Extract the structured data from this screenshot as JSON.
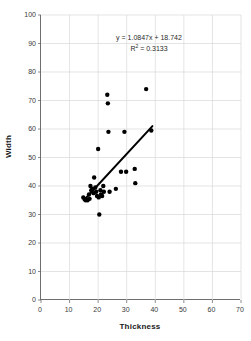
{
  "chart_data": {
    "type": "scatter",
    "title": "",
    "xlabel": "Thickness",
    "ylabel": "Width",
    "xlim": [
      0,
      70
    ],
    "ylim": [
      0,
      100
    ],
    "xticks": [
      0,
      10,
      20,
      30,
      40,
      50,
      60,
      70
    ],
    "yticks": [
      0,
      10,
      20,
      30,
      40,
      50,
      60,
      70,
      80,
      90,
      100
    ],
    "grid": true,
    "legend": false,
    "marker_color": "#000000",
    "gridline_color": "#d9d9d9",
    "axis_color": "#6e6e6e",
    "trendline_color": "#000000",
    "annotations": {
      "equation": "y = 1.0847x + 18.742",
      "r_squared_prefix": "R",
      "r_squared_sup": "2",
      "r_squared_value": " = 0.3133"
    },
    "series": [
      {
        "name": "Thickness vs Width",
        "points": [
          [
            14.8,
            36.0
          ],
          [
            15.2,
            35.5
          ],
          [
            15.6,
            35.0
          ],
          [
            16.0,
            35.2
          ],
          [
            16.3,
            35.0
          ],
          [
            16.8,
            37.0
          ],
          [
            17.0,
            35.5
          ],
          [
            17.3,
            40.0
          ],
          [
            17.6,
            38.5
          ],
          [
            18.0,
            39.0
          ],
          [
            18.4,
            37.5
          ],
          [
            18.6,
            43.0
          ],
          [
            19.0,
            39.5
          ],
          [
            19.3,
            38.0
          ],
          [
            19.6,
            36.5
          ],
          [
            20.0,
            53.0
          ],
          [
            20.2,
            36.0
          ],
          [
            20.4,
            30.0
          ],
          [
            20.8,
            38.5
          ],
          [
            21.0,
            37.0
          ],
          [
            21.4,
            36.5
          ],
          [
            21.8,
            40.0
          ],
          [
            22.0,
            38.0
          ],
          [
            23.2,
            72.0
          ],
          [
            23.4,
            69.0
          ],
          [
            23.6,
            59.0
          ],
          [
            24.0,
            38.0
          ],
          [
            26.2,
            39.0
          ],
          [
            28.0,
            45.0
          ],
          [
            29.2,
            59.0
          ],
          [
            29.8,
            45.0
          ],
          [
            32.8,
            46.0
          ],
          [
            33.0,
            41.0
          ],
          [
            36.8,
            74.0
          ],
          [
            38.6,
            59.5
          ]
        ]
      }
    ],
    "trendline": {
      "slope": 1.0847,
      "intercept": 18.742,
      "x_start": 15.0,
      "x_end": 39.0,
      "y_start": 35.0,
      "y_end": 61.0
    }
  }
}
